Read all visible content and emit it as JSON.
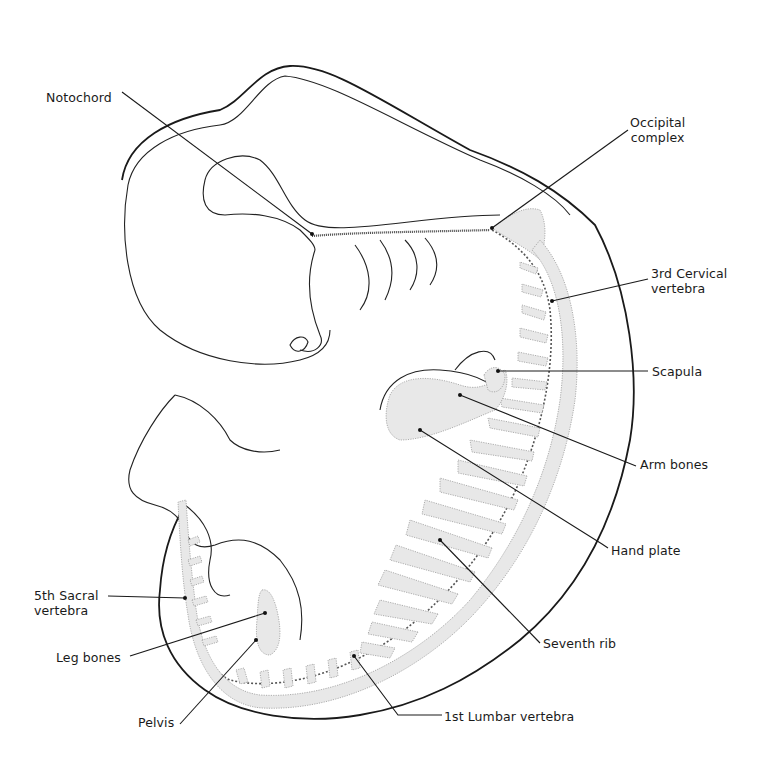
{
  "figure": {
    "labels": {
      "notochord": "Notochord",
      "occipital_line1": "Occipital",
      "occipital_line2": "complex",
      "cervical_line1": "3rd Cervical",
      "cervical_line2": "vertebra",
      "scapula": "Scapula",
      "arm_bones": "Arm bones",
      "hand_plate": "Hand plate",
      "seventh_rib": "Seventh rib",
      "first_lumbar": "1st Lumbar vertebra",
      "sacral_line1": "5th Sacral",
      "sacral_line2": "vertebra",
      "leg_bones": "Leg bones",
      "pelvis": "Pelvis"
    },
    "colors": {
      "ink": "#1a1a1a",
      "stipple": "#9a9a9a",
      "background": "#ffffff"
    }
  }
}
